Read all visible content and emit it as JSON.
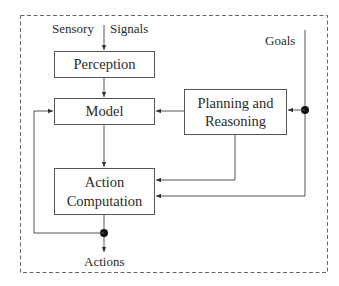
{
  "diagram": {
    "inputs": {
      "sensory_left": "Sensory",
      "sensory_right": "Signals",
      "goals": "Goals"
    },
    "blocks": {
      "perception": "Perception",
      "model": "Model",
      "planning_line1": "Planning and",
      "planning_line2": "Reasoning",
      "action_line1": "Action",
      "action_line2": "Computation"
    },
    "outputs": {
      "actions": "Actions"
    },
    "edges": [
      {
        "from": "Sensory Signals",
        "to": "Perception"
      },
      {
        "from": "Perception",
        "to": "Model"
      },
      {
        "from": "Model",
        "to": "Planning and Reasoning",
        "bidirectional": true
      },
      {
        "from": "Goals",
        "to": "Planning and Reasoning"
      },
      {
        "from": "Goals",
        "to": "Action Computation"
      },
      {
        "from": "Planning and Reasoning",
        "to": "Action Computation"
      },
      {
        "from": "Model",
        "to": "Action Computation"
      },
      {
        "from": "Action Computation",
        "to": "Actions"
      },
      {
        "from": "Actions",
        "to": "Model",
        "feedback": true
      }
    ],
    "colors": {
      "line": "#555555",
      "border_dashed": "#666666",
      "text": "#2a2a2a"
    }
  }
}
